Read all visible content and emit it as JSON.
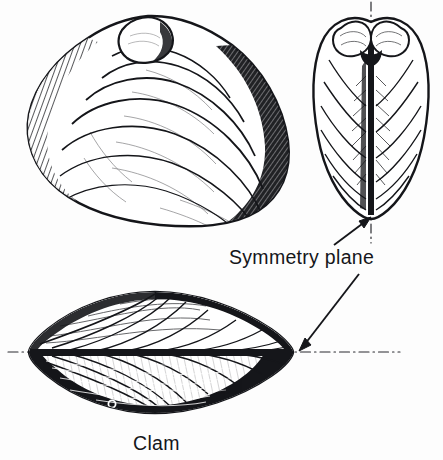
{
  "figure": {
    "title": "Clam",
    "background_color": "#fdfdfd",
    "ink_color": "#15161a",
    "width": 443,
    "height": 460,
    "labels": {
      "symmetry_plane": "Symmetry plane",
      "specimen": "Clam"
    },
    "views": [
      {
        "id": "lateral-view",
        "name": "lateral-valve-view",
        "description": "Left valve seen broadside showing concentric growth rings and umbo",
        "center_x": 157,
        "center_y": 120,
        "width": 265,
        "height": 210,
        "growth_ring_count": 7,
        "umbo_position": "upper-left"
      },
      {
        "id": "anterior-view",
        "name": "anterior-dorsal-view",
        "description": "Both valves seen end-on, heart shaped, bisected by vertical symmetry plane",
        "center_x": 371,
        "center_y": 112,
        "width": 112,
        "height": 205,
        "umbo_count": 2
      },
      {
        "id": "dorsal-view",
        "name": "dorsal-top-view",
        "description": "Both valves seen from above, lens shaped, bisected by horizontal symmetry plane",
        "center_x": 155,
        "center_y": 352,
        "width": 250,
        "height": 125,
        "has_highlight_dot": true
      }
    ],
    "symmetry_lines": [
      {
        "id": "vertical-symmetry-axis",
        "orientation": "vertical",
        "style": "dash-dot",
        "x": 371,
        "y_start": 2,
        "y_end": 243
      },
      {
        "id": "horizontal-symmetry-axis",
        "orientation": "horizontal",
        "style": "dash-dot",
        "y": 352,
        "x_start": 8,
        "x_end": 400
      }
    ],
    "leader_arrows": [
      {
        "id": "arrow-to-anterior-plane",
        "from_x": 336,
        "from_y": 243,
        "to_x": 371,
        "to_y": 218,
        "points_to": "anterior-view"
      },
      {
        "id": "arrow-to-dorsal-plane",
        "from_x": 357,
        "from_y": 276,
        "to_x": 300,
        "to_y": 347,
        "points_to": "dorsal-view"
      }
    ]
  }
}
